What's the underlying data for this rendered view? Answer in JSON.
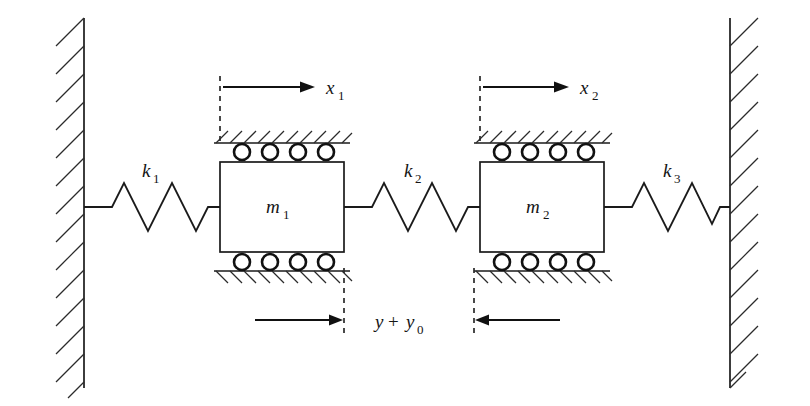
{
  "figure": {
    "type": "mechanical-vibration-schematic",
    "background_color": "#ffffff",
    "line_color": "#1a1a1a"
  },
  "labels": {
    "spring1": {
      "base": "k",
      "sub": "1"
    },
    "spring2": {
      "base": "k",
      "sub": "2"
    },
    "spring3": {
      "base": "k",
      "sub": "3"
    },
    "mass1": {
      "base": "m",
      "sub": "1"
    },
    "mass2": {
      "base": "m",
      "sub": "2"
    },
    "displacement1": {
      "base": "x",
      "sub": "1"
    },
    "displacement2": {
      "base": "x",
      "sub": "2"
    },
    "gap": {
      "base": "y",
      "op": "+",
      "base2": "y",
      "sub2": "0"
    }
  },
  "components": {
    "left_wall": {
      "name": "fixed-wall-left",
      "hatch_direction": "down-left"
    },
    "right_wall": {
      "name": "fixed-wall-right",
      "hatch_direction": "up-right"
    },
    "mass1_rollers_top": 4,
    "mass1_rollers_bottom": 4,
    "mass2_rollers_top": 4,
    "mass2_rollers_bottom": 4,
    "spring_zigzag_peaks": 3
  },
  "arrows": {
    "x1_direction": "right",
    "x2_direction": "right",
    "gap_left_arrow_direction": "right",
    "gap_right_arrow_direction": "left"
  }
}
